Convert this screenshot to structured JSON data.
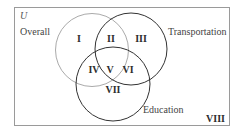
{
  "diagram": {
    "type": "venn",
    "universe_label": "U",
    "colors": {
      "border": "#9a9a9a",
      "overall_circle": "#aaaaaa",
      "transportation_circle": "#333333",
      "education_circle": "#333333",
      "text": "#333333"
    },
    "sets": [
      {
        "name": "Overall",
        "label": "Overall"
      },
      {
        "name": "Transportation",
        "label": "Transportation"
      },
      {
        "name": "Education",
        "label": "Education"
      }
    ],
    "regions": [
      {
        "id": "I",
        "label": "I",
        "membership": "Overall only"
      },
      {
        "id": "II",
        "label": "II",
        "membership": "Overall ∩ Transportation only"
      },
      {
        "id": "III",
        "label": "III",
        "membership": "Transportation only"
      },
      {
        "id": "IV",
        "label": "IV",
        "membership": "Overall ∩ Education only"
      },
      {
        "id": "V",
        "label": "V",
        "membership": "Overall ∩ Transportation ∩ Education"
      },
      {
        "id": "VI",
        "label": "VI",
        "membership": "Transportation ∩ Education only"
      },
      {
        "id": "VII",
        "label": "VII",
        "membership": "Education only"
      },
      {
        "id": "VIII",
        "label": "VIII",
        "membership": "None"
      }
    ]
  }
}
